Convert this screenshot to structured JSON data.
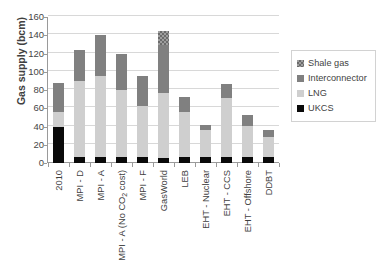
{
  "chart_data": {
    "type": "bar",
    "stacked": true,
    "title": "",
    "xlabel": "",
    "ylabel": "Gas supply (bcm)",
    "ylim": [
      0,
      160
    ],
    "yticks": [
      0,
      20,
      40,
      60,
      80,
      100,
      120,
      140,
      160
    ],
    "grid": true,
    "legend_position": "right",
    "categories": [
      "2010",
      "MPI - D",
      "MPI - A",
      "MPI - A (No CO2 cost)",
      "MPI - F",
      "GasWorld",
      "LEB",
      "EHT - Nuclear",
      "EHT - CCS",
      "EHT - Offshore",
      "DDBT"
    ],
    "series": [
      {
        "name": "UKCS",
        "color": "#0a0a0a",
        "pattern": "solid",
        "values": [
          40,
          7,
          7,
          7,
          7,
          6,
          7,
          7,
          7,
          7,
          7
        ]
      },
      {
        "name": "LNG",
        "color": "#cfcfcf",
        "pattern": "solid",
        "values": [
          16,
          83,
          88,
          73,
          56,
          71,
          49,
          29,
          64,
          34,
          21
        ]
      },
      {
        "name": "Interconnector",
        "color": "#808080",
        "pattern": "solid",
        "values": [
          32,
          34,
          45,
          39,
          32,
          52,
          16,
          6,
          16,
          12,
          8
        ]
      },
      {
        "name": "Shale gas",
        "color": "#9e9e9e",
        "pattern": "checkered",
        "values": [
          0,
          0,
          0,
          0,
          0,
          16,
          0,
          0,
          0,
          0,
          0
        ]
      }
    ],
    "totals": [
      88,
      124,
      140,
      119,
      95,
      145,
      72,
      42,
      87,
      53,
      36
    ]
  },
  "legend": {
    "items": [
      {
        "label": "Shale gas",
        "swatch": "shale-gas-swatch"
      },
      {
        "label": "Interconnector",
        "swatch": "interconnector-swatch"
      },
      {
        "label": "LNG",
        "swatch": "lng-swatch"
      },
      {
        "label": "UKCS",
        "swatch": "ukcs-swatch"
      }
    ]
  }
}
